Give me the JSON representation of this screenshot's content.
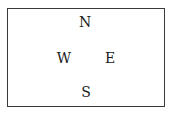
{
  "compass": {
    "north": "N",
    "south": "S",
    "east": "E",
    "west": "W"
  },
  "colors": {
    "border": "#3a3a3a",
    "text": "#1a1a1a",
    "background": "#ffffff"
  }
}
